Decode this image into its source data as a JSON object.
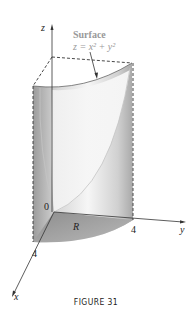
{
  "figure": {
    "caption": "FIGURE 31",
    "surface_label": "Surface",
    "surface_equation": "z = x² + y²",
    "region_label": "R",
    "origin_label": "0",
    "axes": {
      "x": "x",
      "y": "y",
      "z": "z"
    },
    "ticks": {
      "x": "4",
      "y": "4"
    }
  },
  "colors": {
    "axis": "#333333",
    "shade_dark": "#9a9a9a",
    "shade_light": "#e8e8e8",
    "label_gray": "#999999"
  }
}
